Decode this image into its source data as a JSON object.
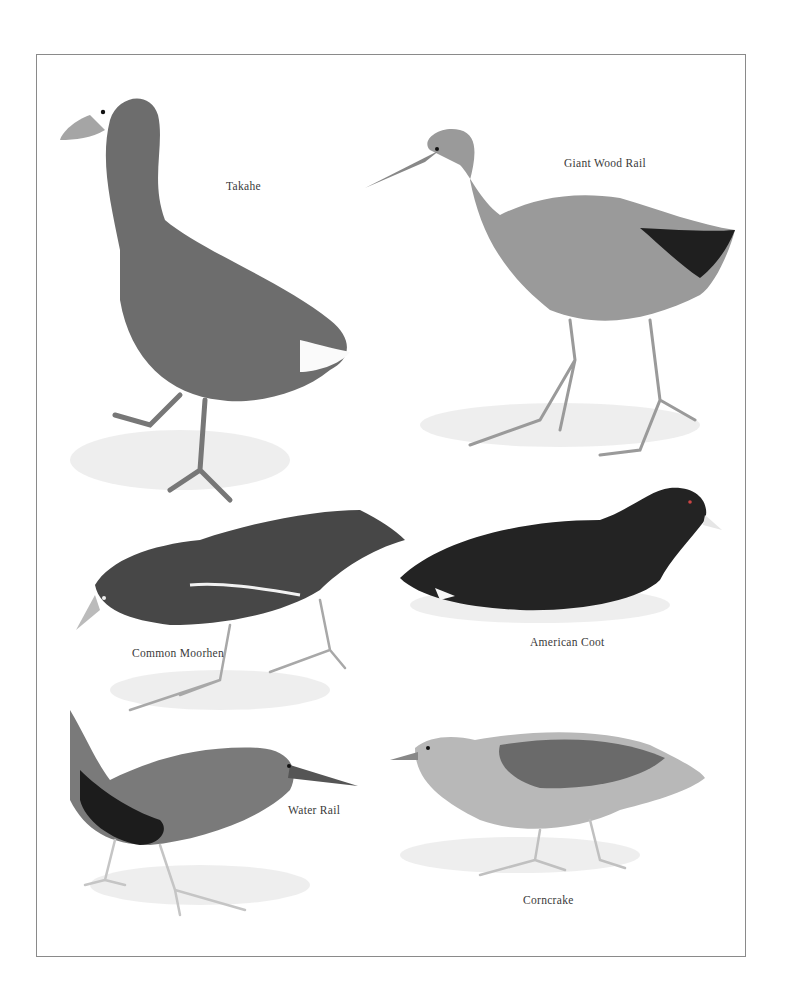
{
  "plate": {
    "birds": [
      {
        "name": "Takahe",
        "label_pos": [
          226,
          187
        ]
      },
      {
        "name": "Giant Wood Rail",
        "label_pos": [
          564,
          164
        ]
      },
      {
        "name": "Common Moorhen",
        "label_pos": [
          132,
          654
        ]
      },
      {
        "name": "American Coot",
        "label_pos": [
          530,
          643
        ]
      },
      {
        "name": "Water Rail",
        "label_pos": [
          288,
          811
        ]
      },
      {
        "name": "Corncrake",
        "label_pos": [
          523,
          901
        ]
      }
    ]
  },
  "colors": {
    "frame": "#8a8a8a",
    "takahe_body": "#6d6d6d",
    "wood_rail_body": "#8f8f8f",
    "moorhen_body": "#4a4a4a",
    "coot_body": "#262626",
    "water_rail_body": "#7a7a7a",
    "corncrake_body": "#b5b5b5"
  }
}
